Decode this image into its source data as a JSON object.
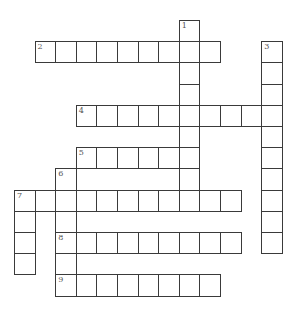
{
  "puzzle": {
    "title": "",
    "grid": {
      "origin_x": 14,
      "origin_y": 20,
      "cell_w": 20.6,
      "cell_h": 21.2
    },
    "entries": [
      {
        "number": "1",
        "direction": "down",
        "col": 8,
        "row": 0,
        "length": 9
      },
      {
        "number": "2",
        "direction": "across",
        "col": 1,
        "row": 1,
        "length": 9
      },
      {
        "number": "3",
        "direction": "down",
        "col": 12,
        "row": 1,
        "length": 10
      },
      {
        "number": "4",
        "direction": "across",
        "col": 3,
        "row": 4,
        "length": 10
      },
      {
        "number": "5",
        "direction": "across",
        "col": 3,
        "row": 6,
        "length": 6
      },
      {
        "number": "6",
        "direction": "down",
        "col": 2,
        "row": 7,
        "length": 6
      },
      {
        "number": "7",
        "direction": "across",
        "col": 0,
        "row": 8,
        "length": 11
      },
      {
        "number": "7",
        "direction": "down",
        "col": 0,
        "row": 8,
        "length": 4
      },
      {
        "number": "8",
        "direction": "across",
        "col": 2,
        "row": 10,
        "length": 9
      },
      {
        "number": "9",
        "direction": "across",
        "col": 2,
        "row": 12,
        "length": 8
      }
    ]
  }
}
